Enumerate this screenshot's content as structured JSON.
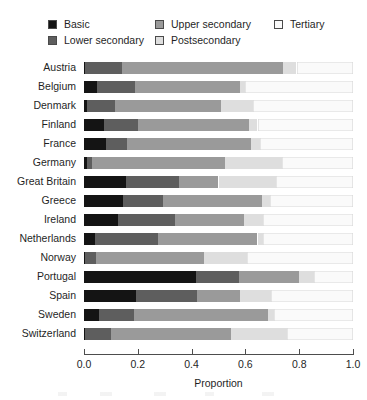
{
  "legend": {
    "items": [
      {
        "label": "Basic",
        "color": "#141414",
        "key": "basic"
      },
      {
        "label": "Lower secondary",
        "color": "#5e5e5e",
        "key": "lower_secondary"
      },
      {
        "label": "Upper secondary",
        "color": "#9a9a9a",
        "key": "upper_secondary"
      },
      {
        "label": "Postsecondary",
        "color": "#dedede",
        "key": "postsecondary"
      },
      {
        "label": "Tertiary",
        "color": "#fafafa",
        "key": "tertiary"
      }
    ]
  },
  "axis": {
    "title": "Proportion",
    "ticks": [
      "0.0",
      "0.2",
      "0.4",
      "0.6",
      "0.8",
      "1.0"
    ],
    "tick_values": [
      0.0,
      0.2,
      0.4,
      0.6,
      0.8,
      1.0
    ],
    "min": 0.0,
    "max": 1.0
  },
  "chart_data": {
    "type": "bar",
    "orientation": "horizontal",
    "stacked": true,
    "normalized": true,
    "title": "",
    "xlabel": "Proportion",
    "ylabel": "",
    "xlim": [
      0.0,
      1.0
    ],
    "grid": false,
    "legend_position": "top",
    "categories": [
      "Austria",
      "Belgium",
      "Denmark",
      "Finland",
      "France",
      "Germany",
      "Great Britain",
      "Greece",
      "Ireland",
      "Netherlands",
      "Norway",
      "Portugal",
      "Spain",
      "Sweden",
      "Switzerland"
    ],
    "series": [
      {
        "name": "Basic",
        "color": "#141414",
        "values": [
          0.005,
          0.05,
          0.01,
          0.075,
          0.08,
          0.01,
          0.155,
          0.145,
          0.125,
          0.04,
          0.002,
          0.415,
          0.195,
          0.055,
          0.005
        ]
      },
      {
        "name": "Lower secondary",
        "color": "#5e5e5e",
        "values": [
          0.135,
          0.14,
          0.105,
          0.125,
          0.08,
          0.02,
          0.2,
          0.15,
          0.215,
          0.235,
          0.043,
          0.16,
          0.225,
          0.13,
          0.095
        ]
      },
      {
        "name": "Upper secondary",
        "color": "#9a9a9a",
        "values": [
          0.6,
          0.39,
          0.395,
          0.415,
          0.46,
          0.495,
          0.145,
          0.365,
          0.255,
          0.37,
          0.4,
          0.225,
          0.16,
          0.5,
          0.445
        ]
      },
      {
        "name": "Postsecondary",
        "color": "#dedede",
        "values": [
          0.05,
          0.02,
          0.12,
          0.03,
          0.035,
          0.21,
          0.215,
          0.03,
          0.07,
          0.02,
          0.16,
          0.055,
          0.115,
          0.02,
          0.21
        ]
      },
      {
        "name": "Tertiary",
        "color": "#fafafa",
        "values": [
          0.21,
          0.4,
          0.37,
          0.355,
          0.345,
          0.265,
          0.285,
          0.31,
          0.335,
          0.335,
          0.395,
          0.145,
          0.305,
          0.295,
          0.245
        ]
      }
    ],
    "cumulative_endpoints": [
      {
        "category": "Austria",
        "ends": [
          0.005,
          0.14,
          0.74,
          0.79,
          1.0
        ]
      },
      {
        "category": "Belgium",
        "ends": [
          0.05,
          0.19,
          0.58,
          0.6,
          1.0
        ]
      },
      {
        "category": "Denmark",
        "ends": [
          0.01,
          0.115,
          0.51,
          0.63,
          1.0
        ]
      },
      {
        "category": "Finland",
        "ends": [
          0.075,
          0.2,
          0.615,
          0.645,
          1.0
        ]
      },
      {
        "category": "France",
        "ends": [
          0.08,
          0.16,
          0.62,
          0.655,
          1.0
        ]
      },
      {
        "category": "Germany",
        "ends": [
          0.01,
          0.03,
          0.525,
          0.735,
          1.0
        ]
      },
      {
        "category": "Great Britain",
        "ends": [
          0.155,
          0.355,
          0.5,
          0.715,
          1.0
        ]
      },
      {
        "category": "Greece",
        "ends": [
          0.145,
          0.295,
          0.66,
          0.69,
          1.0
        ]
      },
      {
        "category": "Ireland",
        "ends": [
          0.125,
          0.34,
          0.595,
          0.665,
          1.0
        ]
      },
      {
        "category": "Netherlands",
        "ends": [
          0.04,
          0.275,
          0.645,
          0.665,
          1.0
        ]
      },
      {
        "category": "Norway",
        "ends": [
          0.002,
          0.045,
          0.445,
          0.605,
          1.0
        ]
      },
      {
        "category": "Portugal",
        "ends": [
          0.415,
          0.575,
          0.8,
          0.855,
          1.0
        ]
      },
      {
        "category": "Spain",
        "ends": [
          0.195,
          0.42,
          0.58,
          0.695,
          1.0
        ]
      },
      {
        "category": "Sweden",
        "ends": [
          0.055,
          0.185,
          0.685,
          0.705,
          1.0
        ]
      },
      {
        "category": "Switzerland",
        "ends": [
          0.005,
          0.1,
          0.545,
          0.755,
          1.0
        ]
      }
    ]
  }
}
